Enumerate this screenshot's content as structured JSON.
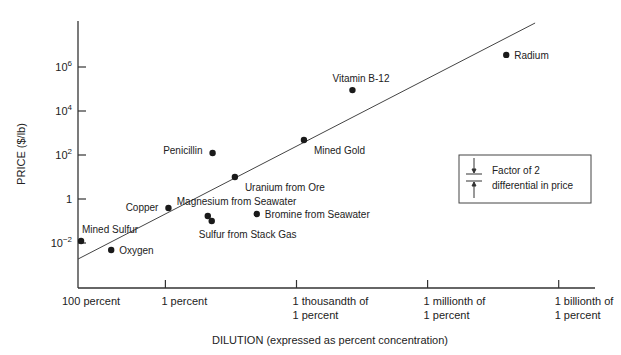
{
  "chart_data": {
    "type": "scatter",
    "title": "",
    "xlabel": "DILUTION (expressed as percent concentration)",
    "ylabel": "PRICE ($/lb)",
    "x_scale": "log",
    "y_scale": "log",
    "x_units": "log10 of percent concentration",
    "y_units": "log10 of price in $/lb",
    "xlim": [
      2,
      -9.5
    ],
    "ylim": [
      -3.6,
      8.0
    ],
    "grid": false,
    "x_ticks": [
      {
        "value": 2,
        "lines": [
          "100 percent"
        ]
      },
      {
        "value": 0,
        "lines": [
          "1 percent"
        ]
      },
      {
        "value": -3,
        "lines": [
          "1 thousandth of",
          "1 percent"
        ]
      },
      {
        "value": -6,
        "lines": [
          "1 millionth of",
          "1 percent"
        ]
      },
      {
        "value": -9,
        "lines": [
          "1 billionth of",
          "1 percent"
        ]
      }
    ],
    "y_ticks": [
      {
        "value": 6,
        "base": "10",
        "exp": "6"
      },
      {
        "value": 4,
        "base": "10",
        "exp": "4"
      },
      {
        "value": 2,
        "base": "10",
        "exp": "2"
      },
      {
        "value": 0,
        "base": "1",
        "exp": ""
      },
      {
        "value": -2,
        "base": "10",
        "exp": "-2"
      }
    ],
    "points": [
      {
        "name": "Mined Sulfur",
        "log_pct": 1.93,
        "log_price": -1.91,
        "label_pos": "above-right"
      },
      {
        "name": "Oxygen",
        "log_pct": 1.24,
        "log_price": -2.32,
        "label_pos": "right"
      },
      {
        "name": "Copper",
        "log_pct": -0.07,
        "log_price": -0.41,
        "label_pos": "left"
      },
      {
        "name": "Penicillin",
        "log_pct": -1.08,
        "log_price": 2.09,
        "label_pos": "left"
      },
      {
        "name": "Magnesium from Seawater",
        "log_pct": -0.97,
        "log_price": -0.77,
        "label_pos": "above-right"
      },
      {
        "name": "Sulfur from Stack Gas",
        "log_pct": -1.06,
        "log_price": -1.0,
        "label_pos": "below"
      },
      {
        "name": "Uranium from Ore",
        "log_pct": -1.59,
        "log_price": 1.0,
        "label_pos": "below-right"
      },
      {
        "name": "Bromine from Seawater",
        "log_pct": -2.09,
        "log_price": -0.68,
        "label_pos": "right"
      },
      {
        "name": "Mined Gold",
        "log_pct": -3.17,
        "log_price": 2.68,
        "label_pos": "below-right"
      },
      {
        "name": "Vitamin B-12",
        "log_pct": -4.28,
        "log_price": 4.95,
        "label_pos": "above"
      },
      {
        "name": "Radium",
        "log_pct": -7.8,
        "log_price": 6.55,
        "label_pos": "right"
      }
    ],
    "trend_line": {
      "from": {
        "log_pct": 2,
        "log_price": -2.73
      },
      "to": {
        "log_pct": -8.46,
        "log_price": 8.0
      }
    },
    "legend": {
      "position": "right",
      "lines": [
        "Factor of 2",
        "differential in price"
      ],
      "symbol": "factor-of-2-bracket"
    }
  }
}
